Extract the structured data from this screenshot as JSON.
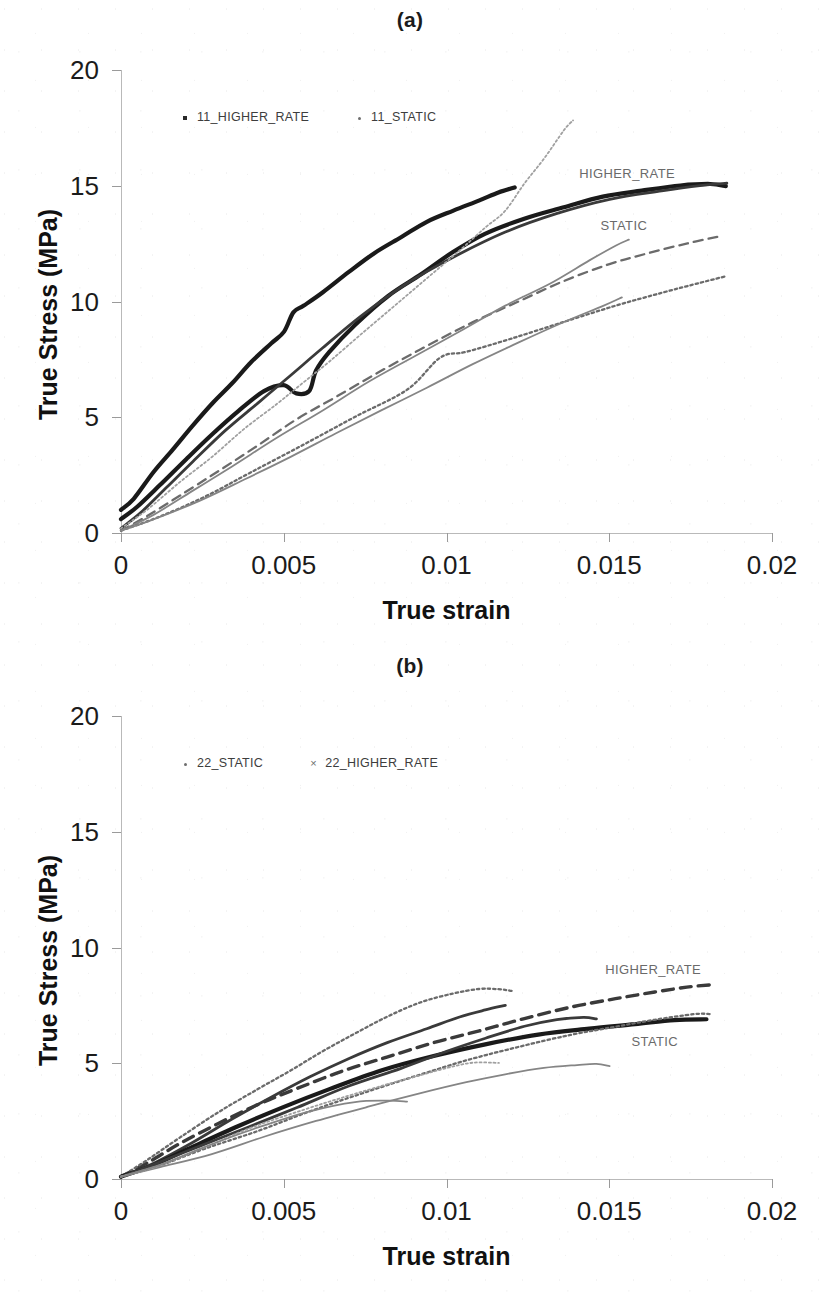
{
  "figure": {
    "background": "#ffffff",
    "panels": [
      "a",
      "b"
    ]
  },
  "panel_a": {
    "title": "(a)",
    "legend": [
      {
        "label": "11_HIGHER_RATE",
        "marker": "square-marker-icon",
        "color": "#2a2a2a"
      },
      {
        "label": "11_STATIC",
        "marker": "dot-marker-icon",
        "color": "#6e6e6e"
      }
    ],
    "annotations": [
      {
        "text": "HIGHER_RATE",
        "x": 0.01555,
        "y": 15.55
      },
      {
        "text": "STATIC",
        "x": 0.01545,
        "y": 13.3
      }
    ]
  },
  "panel_b": {
    "title": "(b)",
    "legend": [
      {
        "label": "22_STATIC",
        "marker": "dot-marker-icon",
        "color": "#6e6e6e"
      },
      {
        "label": "22_HIGHER_RATE",
        "marker": "cross-marker-icon",
        "color": "#6e6e6e"
      }
    ],
    "annotations": [
      {
        "text": "HIGHER_RATE",
        "x": 0.01635,
        "y": 9.05
      },
      {
        "text": "STATIC",
        "x": 0.0164,
        "y": 5.95
      }
    ]
  },
  "axes": {
    "xlabel": "True strain",
    "ylabel": "True Stress (MPa)",
    "xticks": [
      "0",
      "0.005",
      "0.01",
      "0.015",
      "0.02"
    ],
    "xtick_values": [
      0,
      0.005,
      0.01,
      0.015,
      0.02
    ],
    "yticks": [
      "0",
      "5",
      "10",
      "15",
      "20"
    ],
    "ytick_values": [
      0,
      5,
      10,
      15,
      20
    ],
    "xlim": [
      0,
      0.02
    ],
    "ylim": [
      0,
      20
    ],
    "grid": false
  },
  "chart_data": [
    {
      "type": "line",
      "panel": "a",
      "title": "(a)",
      "xlabel": "True strain",
      "ylabel": "True Stress (MPa)",
      "xlim": [
        0,
        0.02
      ],
      "ylim": [
        0,
        20
      ],
      "xticks": [
        0,
        0.005,
        0.01,
        0.015,
        0.02
      ],
      "yticks": [
        0,
        5,
        10,
        15,
        20
      ],
      "grid": false,
      "legend": [
        "11_HIGHER_RATE",
        "11_STATIC"
      ],
      "legend_position": "inside-upper-left",
      "annotations": [
        "HIGHER_RATE",
        "STATIC"
      ],
      "series": [
        {
          "name": "11_HIGHER_RATE_1",
          "group": "HIGHER_RATE",
          "style": "solid-thick",
          "color": "#1a1a1a",
          "x": [
            0,
            0.0004,
            0.001,
            0.0016,
            0.0022,
            0.0028,
            0.0034,
            0.004,
            0.0046,
            0.005,
            0.0053,
            0.0056,
            0.0062,
            0.007,
            0.0078,
            0.0086,
            0.0094,
            0.0102,
            0.011,
            0.0116,
            0.0121
          ],
          "y": [
            1.0,
            1.5,
            2.6,
            3.6,
            4.6,
            5.6,
            6.5,
            7.4,
            8.2,
            8.7,
            9.5,
            9.8,
            10.4,
            11.3,
            12.1,
            12.8,
            13.4,
            13.9,
            14.4,
            14.7,
            14.9
          ]
        },
        {
          "name": "11_HIGHER_RATE_2",
          "group": "HIGHER_RATE",
          "style": "solid-thick",
          "color": "#1a1a1a",
          "x": [
            0,
            0.0005,
            0.0012,
            0.002,
            0.0028,
            0.0036,
            0.0044,
            0.005,
            0.0054,
            0.0058,
            0.006,
            0.0064,
            0.0072,
            0.0082,
            0.0092,
            0.0102,
            0.0112,
            0.0124,
            0.0136,
            0.0148,
            0.016,
            0.0172,
            0.0181,
            0.0186
          ],
          "y": [
            0.6,
            1.1,
            2.1,
            3.2,
            4.3,
            5.3,
            6.1,
            6.4,
            6.0,
            6.1,
            7.0,
            7.8,
            9.0,
            10.2,
            11.2,
            12.1,
            12.9,
            13.6,
            14.1,
            14.5,
            14.8,
            15.0,
            15.05,
            15.0
          ]
        },
        {
          "name": "11_HIGHER_RATE_3",
          "group": "HIGHER_RATE",
          "style": "solid-medium",
          "color": "#3a3a3a",
          "x": [
            0,
            0.0006,
            0.0014,
            0.0022,
            0.0032,
            0.0042,
            0.0052,
            0.0062,
            0.0074,
            0.0088,
            0.0102,
            0.0118,
            0.0134,
            0.015,
            0.0166,
            0.0178,
            0.0186
          ],
          "y": [
            0.2,
            0.9,
            2.0,
            3.1,
            4.4,
            5.6,
            6.8,
            8.0,
            9.4,
            10.8,
            11.9,
            13.0,
            13.8,
            14.4,
            14.8,
            15.0,
            15.1
          ]
        },
        {
          "name": "11_STATIC_peak",
          "group": "STATIC",
          "style": "dotted-thin",
          "color": "#5f5f5f",
          "x": [
            0,
            0.0008,
            0.0018,
            0.0028,
            0.0038,
            0.0048,
            0.0056,
            0.0064,
            0.0074,
            0.0084,
            0.0094,
            0.0104,
            0.0112,
            0.0118,
            0.0124,
            0.013,
            0.0136,
            0.0139
          ],
          "y": [
            0.2,
            1.0,
            2.2,
            3.3,
            4.5,
            5.6,
            6.5,
            7.4,
            8.6,
            9.8,
            11.0,
            12.2,
            13.2,
            13.9,
            15.1,
            16.2,
            17.4,
            17.8
          ]
        },
        {
          "name": "11_STATIC_1",
          "group": "STATIC",
          "style": "dashed",
          "color": "#6b6b6b",
          "x": [
            0,
            0.0008,
            0.0018,
            0.003,
            0.0042,
            0.0054,
            0.0066,
            0.008,
            0.0094,
            0.0108,
            0.0122,
            0.0136,
            0.015,
            0.0162,
            0.0174,
            0.0184
          ],
          "y": [
            0.1,
            0.7,
            1.6,
            2.7,
            3.8,
            4.9,
            5.9,
            7.0,
            8.1,
            9.1,
            10.0,
            10.9,
            11.6,
            12.1,
            12.5,
            12.8
          ]
        },
        {
          "name": "11_STATIC_2",
          "group": "STATIC",
          "style": "solid-thin",
          "color": "#7a7a7a",
          "x": [
            0,
            0.001,
            0.0022,
            0.0034,
            0.0048,
            0.0062,
            0.0076,
            0.009,
            0.0104,
            0.0118,
            0.0132,
            0.0144,
            0.0152,
            0.0156
          ],
          "y": [
            0.1,
            0.8,
            1.8,
            2.9,
            4.1,
            5.3,
            6.5,
            7.6,
            8.7,
            9.8,
            10.8,
            11.8,
            12.4,
            12.7
          ]
        },
        {
          "name": "11_STATIC_3",
          "group": "STATIC",
          "style": "dotted",
          "color": "#8a8a8a",
          "x": [
            0,
            0.0012,
            0.0026,
            0.004,
            0.0056,
            0.0072,
            0.0088,
            0.0098,
            0.0106,
            0.012,
            0.0136,
            0.0152,
            0.0166,
            0.0178,
            0.0186
          ],
          "y": [
            0.1,
            0.7,
            1.6,
            2.6,
            3.8,
            5.0,
            6.2,
            7.6,
            7.8,
            8.4,
            9.1,
            9.8,
            10.4,
            10.8,
            11.1
          ]
        },
        {
          "name": "11_STATIC_4",
          "group": "STATIC",
          "style": "solid-thin",
          "color": "#9a9a9a",
          "x": [
            0,
            0.001,
            0.0024,
            0.0038,
            0.0052,
            0.0066,
            0.008,
            0.0094,
            0.0108,
            0.0122,
            0.0136,
            0.0148,
            0.0154
          ],
          "y": [
            0.1,
            0.6,
            1.4,
            2.3,
            3.3,
            4.3,
            5.3,
            6.3,
            7.3,
            8.2,
            9.1,
            9.8,
            10.2
          ]
        }
      ]
    },
    {
      "type": "line",
      "panel": "b",
      "title": "(b)",
      "xlabel": "True strain",
      "ylabel": "True Stress (MPa)",
      "xlim": [
        0,
        0.02
      ],
      "ylim": [
        0,
        20
      ],
      "xticks": [
        0,
        0.005,
        0.01,
        0.015,
        0.02
      ],
      "yticks": [
        0,
        5,
        10,
        15,
        20
      ],
      "grid": false,
      "legend": [
        "22_STATIC",
        "22_HIGHER_RATE"
      ],
      "legend_position": "inside-upper-left",
      "annotations": [
        "HIGHER_RATE",
        "STATIC"
      ],
      "series": [
        {
          "name": "22_HIGHER_RATE_dashed",
          "group": "HIGHER_RATE",
          "style": "dashed-thick",
          "color": "#4a4a4a",
          "x": [
            0,
            0.0008,
            0.0018,
            0.003,
            0.0042,
            0.0054,
            0.0068,
            0.0082,
            0.0096,
            0.011,
            0.0124,
            0.0138,
            0.0152,
            0.0164,
            0.0174,
            0.0181
          ],
          "y": [
            0.1,
            0.7,
            1.5,
            2.4,
            3.2,
            3.9,
            4.7,
            5.3,
            5.9,
            6.4,
            6.9,
            7.4,
            7.8,
            8.1,
            8.3,
            8.4
          ]
        },
        {
          "name": "22_HIGHER_RATE_1",
          "group": "HIGHER_RATE",
          "style": "dotted",
          "color": "#767676",
          "x": [
            0,
            0.0008,
            0.0018,
            0.003,
            0.0042,
            0.0052,
            0.0062,
            0.0072,
            0.0082,
            0.0092,
            0.0102,
            0.011,
            0.0116,
            0.012
          ],
          "y": [
            0.1,
            0.8,
            1.8,
            2.9,
            3.9,
            4.7,
            5.5,
            6.3,
            7.0,
            7.6,
            8.0,
            8.2,
            8.2,
            8.1
          ]
        },
        {
          "name": "22_HIGHER_RATE_2",
          "group": "HIGHER_RATE",
          "style": "solid-medium",
          "color": "#5a5a5a",
          "x": [
            0,
            0.001,
            0.0022,
            0.0034,
            0.0046,
            0.0058,
            0.007,
            0.0082,
            0.0094,
            0.0104,
            0.0112,
            0.0118
          ],
          "y": [
            0.1,
            0.7,
            1.6,
            2.6,
            3.5,
            4.4,
            5.2,
            5.9,
            6.5,
            7.0,
            7.3,
            7.5
          ]
        },
        {
          "name": "22_STATIC_1",
          "group": "STATIC",
          "style": "solid-thick",
          "color": "#555555",
          "x": [
            0,
            0.001,
            0.0022,
            0.0036,
            0.005,
            0.0064,
            0.008,
            0.0096,
            0.0112,
            0.0128,
            0.0144,
            0.0158,
            0.017,
            0.018
          ],
          "y": [
            0.1,
            0.6,
            1.4,
            2.3,
            3.1,
            3.9,
            4.7,
            5.3,
            5.8,
            6.2,
            6.5,
            6.7,
            6.85,
            6.9
          ]
        },
        {
          "name": "22_STATIC_2",
          "group": "STATIC",
          "style": "solid-medium",
          "color": "#636363",
          "x": [
            0,
            0.001,
            0.0024,
            0.0038,
            0.0054,
            0.007,
            0.0086,
            0.01,
            0.0112,
            0.0124,
            0.0134,
            0.0142,
            0.0146
          ],
          "y": [
            0.1,
            0.6,
            1.4,
            2.2,
            3.1,
            4.0,
            4.8,
            5.5,
            6.1,
            6.6,
            6.9,
            7.0,
            6.9
          ]
        },
        {
          "name": "22_STATIC_3",
          "group": "STATIC",
          "style": "dotted",
          "color": "#7d7d7d",
          "x": [
            0,
            0.0012,
            0.0026,
            0.0042,
            0.0058,
            0.0074,
            0.009,
            0.0106,
            0.0122,
            0.0138,
            0.0152,
            0.0164,
            0.0176,
            0.0181
          ],
          "y": [
            0.1,
            0.6,
            1.3,
            2.1,
            2.9,
            3.7,
            4.4,
            5.1,
            5.7,
            6.2,
            6.6,
            6.9,
            7.1,
            7.15
          ]
        },
        {
          "name": "22_STATIC_4",
          "group": "STATIC",
          "style": "solid-thin",
          "color": "#8c8c8c",
          "x": [
            0,
            0.0012,
            0.0028,
            0.0044,
            0.006,
            0.0076,
            0.0092,
            0.0106,
            0.0118,
            0.013,
            0.014,
            0.0146,
            0.015
          ],
          "y": [
            0.1,
            0.5,
            1.1,
            1.8,
            2.5,
            3.1,
            3.7,
            4.2,
            4.5,
            4.8,
            4.9,
            4.95,
            4.9
          ]
        },
        {
          "name": "22_STATIC_5",
          "group": "STATIC",
          "style": "dotted-thin",
          "color": "#999999",
          "x": [
            0,
            0.0012,
            0.0026,
            0.004,
            0.0056,
            0.007,
            0.0082,
            0.0092,
            0.01,
            0.0108,
            0.0116
          ],
          "y": [
            0.1,
            0.6,
            1.4,
            2.2,
            3.0,
            3.6,
            4.1,
            4.5,
            4.8,
            5.0,
            5.0
          ]
        },
        {
          "name": "22_STATIC_6",
          "group": "STATIC",
          "style": "solid-thin",
          "color": "#8f8f8f",
          "x": [
            0,
            0.0012,
            0.0026,
            0.0042,
            0.0058,
            0.0072,
            0.0082,
            0.0088
          ],
          "y": [
            0.1,
            0.6,
            1.4,
            2.2,
            2.9,
            3.3,
            3.4,
            3.35
          ]
        }
      ]
    }
  ]
}
